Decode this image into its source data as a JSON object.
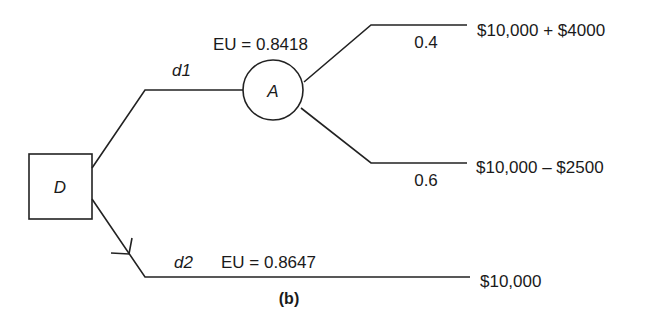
{
  "diagram": {
    "type": "decision-tree",
    "caption": "(b)",
    "decision_node": {
      "label": "D",
      "shape": "square"
    },
    "chance_node": {
      "label": "A",
      "shape": "circle",
      "eu_label": "EU = 0.8418"
    },
    "branches": [
      {
        "id": "d1",
        "label": "d1",
        "to": "A"
      },
      {
        "id": "d2",
        "label": "d2",
        "eu_label": "EU = 0.8647",
        "outcome": "$10,000",
        "chosen": true
      }
    ],
    "chance_branches": [
      {
        "probability": "0.4",
        "outcome": "$10,000 + $4000"
      },
      {
        "probability": "0.6",
        "outcome": "$10,000 – $2500"
      }
    ]
  }
}
